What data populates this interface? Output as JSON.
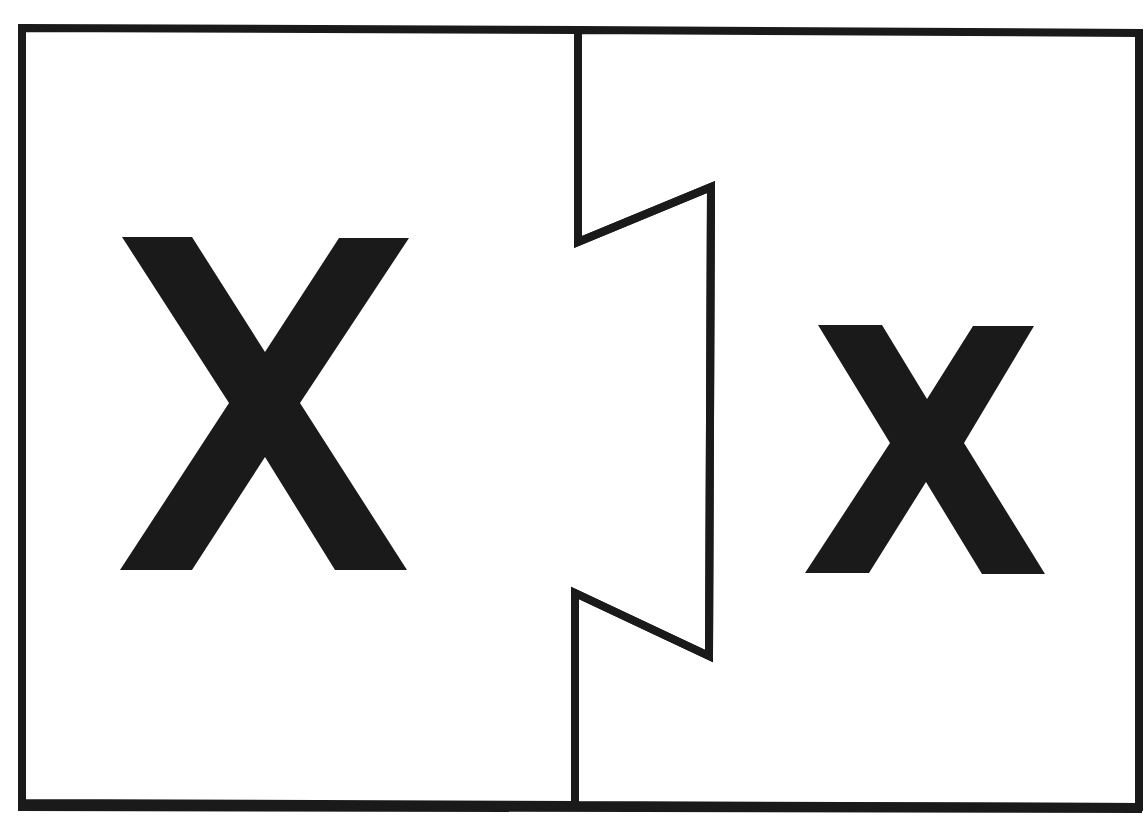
{
  "worksheet": {
    "title": "Letter X puzzle",
    "left_piece": {
      "letter": "X",
      "case": "uppercase"
    },
    "right_piece": {
      "letter": "x",
      "case": "lowercase"
    }
  },
  "colors": {
    "ink": "#1a1a1a",
    "paper": "#ffffff"
  }
}
